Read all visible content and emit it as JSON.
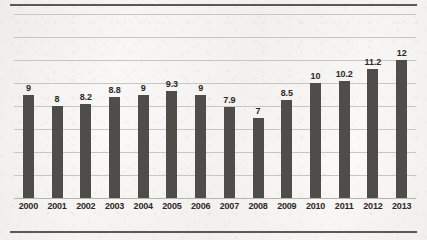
{
  "chart_data": {
    "type": "bar",
    "title": "",
    "subtitle": "",
    "xlabel": "",
    "ylabel": "",
    "categories": [
      "2000",
      "2001",
      "2002",
      "2003",
      "2004",
      "2005",
      "2006",
      "2007",
      "2008",
      "2009",
      "2010",
      "2011",
      "2012",
      "2013"
    ],
    "values": [
      9,
      8,
      8.2,
      8.8,
      9,
      9.3,
      9,
      7.9,
      7,
      8.5,
      10,
      10.2,
      11.2,
      12
    ],
    "value_labels": [
      "9",
      "8",
      "8.2",
      "8.8",
      "9",
      "9.3",
      "9",
      "7.9",
      "7",
      "8.5",
      "10",
      "10.2",
      "11.2",
      "12"
    ],
    "ylim": [
      0,
      16
    ],
    "ytick_step": 2,
    "ytick_labels_visible": false,
    "grid": true,
    "gridline_count": 8,
    "legend": null,
    "legend_position": "none",
    "bar_color": "#4f4d4a",
    "gridline_color": "#c9c6c1",
    "frame_color": "#5c5955",
    "background_color": "#fbfaf8",
    "label_color": "#2b2927",
    "data_labels_shown": true
  }
}
